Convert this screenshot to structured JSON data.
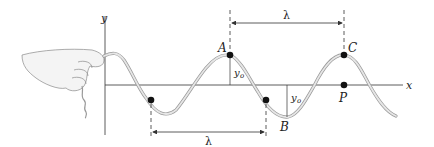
{
  "diagram": {
    "axes": {
      "x_label": "x",
      "y_label": "y"
    },
    "points": [
      {
        "id": "A",
        "label": "A",
        "role": "crest"
      },
      {
        "id": "B",
        "label": "B",
        "role": "trough"
      },
      {
        "id": "C",
        "label": "C",
        "role": "crest"
      },
      {
        "id": "P",
        "label": "P",
        "role": "point on x-axis"
      }
    ],
    "amplitude_labels": {
      "at_A": "y",
      "at_A_sub": "o",
      "at_B": "y",
      "at_B_sub": "o"
    },
    "wavelength_labels": {
      "top": "λ",
      "bottom": "λ"
    },
    "colors": {
      "wave": "#c8c8c8",
      "wave_edge": "#9a9a9a",
      "axis": "#333333",
      "dot": "#111111"
    }
  }
}
